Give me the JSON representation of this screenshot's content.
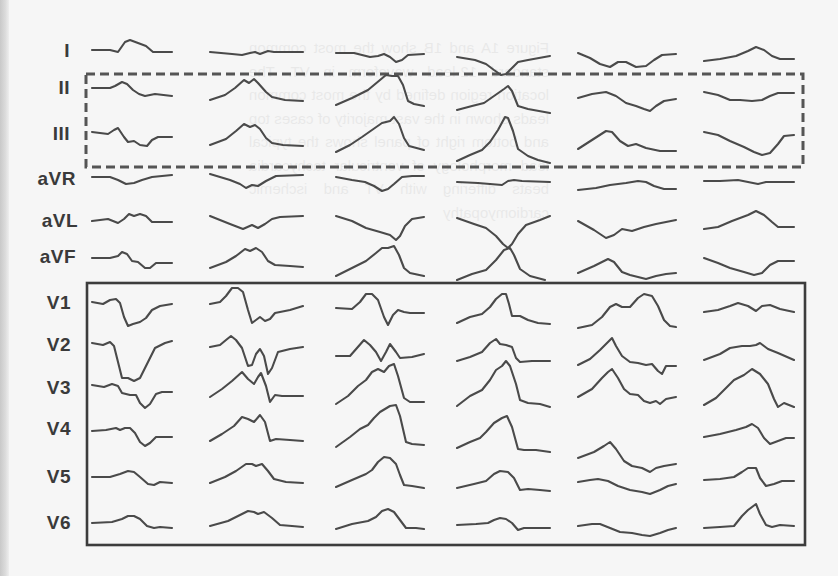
{
  "figure": {
    "type": "12-lead ECG waveform panel",
    "lead_labels": [
      "I",
      "II",
      "III",
      "aVR",
      "aVL",
      "aVF",
      "V1",
      "V2",
      "V3",
      "V4",
      "V5",
      "V6"
    ],
    "column_count": 6,
    "highlight_boxes": [
      {
        "style": "dashed",
        "encloses_leads": [
          "II",
          "III"
        ]
      },
      {
        "style": "solid",
        "encloses_leads": [
          "V1",
          "V2",
          "V3",
          "V4",
          "V5",
          "V6"
        ]
      }
    ],
    "colors": {
      "background": "#f6f6f6",
      "trace": "#4a4a4a",
      "label": "#3a3a3a",
      "dashed_box": "#555555",
      "solid_box": "#3c3c3c"
    }
  },
  "bleed_through_text": "Figure 1A and 1B show the most common standard 12-lead waveform in VT. The location region defined by the most common leads shown in the vast majority of cases top and bottom right of panel shows the typical lead morphology of ventricular tachycardia beats differing with VT and ischemic cardiomyopathy"
}
